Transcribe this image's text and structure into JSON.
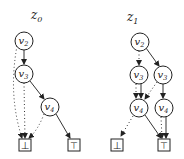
{
  "diagrams": [
    {
      "title": "z",
      "title_sub": "0",
      "nodes": [
        {
          "id": "v2",
          "label": "v",
          "sub": "2"
        },
        {
          "id": "v3",
          "label": "v",
          "sub": "3"
        },
        {
          "id": "v4",
          "label": "v",
          "sub": "4"
        }
      ],
      "terminals": [
        {
          "id": "bot",
          "label": "⊥"
        },
        {
          "id": "top",
          "label": "⊤"
        }
      ],
      "edges": [
        {
          "from": "v2",
          "to": "v3",
          "style": "solid"
        },
        {
          "from": "v2",
          "to": "bot",
          "style": "dotted"
        },
        {
          "from": "v3",
          "to": "v4",
          "style": "solid"
        },
        {
          "from": "v3",
          "to": "bot",
          "style": "dotted"
        },
        {
          "from": "v4",
          "to": "top",
          "style": "solid"
        },
        {
          "from": "v4",
          "to": "bot",
          "style": "dotted"
        }
      ]
    },
    {
      "title": "z",
      "title_sub": "1",
      "nodes": [
        {
          "id": "v2",
          "label": "v",
          "sub": "2"
        },
        {
          "id": "v3a",
          "label": "v",
          "sub": "3"
        },
        {
          "id": "v3b",
          "label": "v",
          "sub": "3"
        },
        {
          "id": "v4a",
          "label": "v",
          "sub": "4"
        },
        {
          "id": "v4b",
          "label": "v",
          "sub": "4"
        }
      ],
      "terminals": [
        {
          "id": "bot",
          "label": "⊥"
        },
        {
          "id": "top",
          "label": "⊤"
        }
      ],
      "edges": [
        {
          "from": "v2",
          "to": "v3b",
          "style": "solid"
        },
        {
          "from": "v2",
          "to": "v3a",
          "style": "dotted"
        },
        {
          "from": "v3a",
          "to": "v4a",
          "style": "solid"
        },
        {
          "from": "v3a",
          "to": "v4a",
          "style": "dotted"
        },
        {
          "from": "v3b",
          "to": "v4b",
          "style": "solid"
        },
        {
          "from": "v3b",
          "to": "v4a",
          "style": "dotted"
        },
        {
          "from": "v4a",
          "to": "top",
          "style": "solid"
        },
        {
          "from": "v4a",
          "to": "bot",
          "style": "dotted"
        },
        {
          "from": "v4b",
          "to": "top",
          "style": "solid"
        },
        {
          "from": "v4b",
          "to": "top",
          "style": "dotted"
        }
      ]
    }
  ]
}
